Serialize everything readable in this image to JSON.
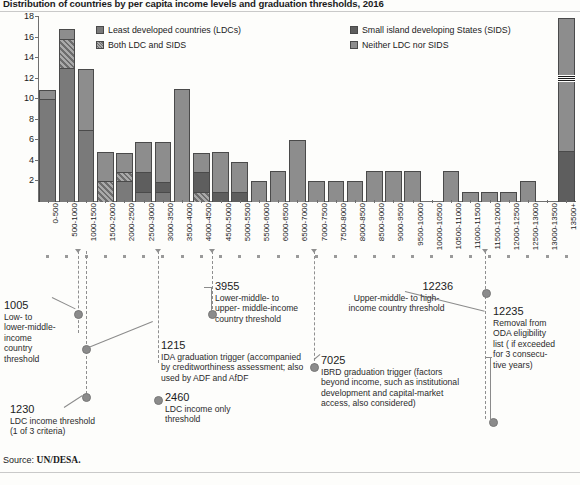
{
  "title": "Distribution of countries by per capita income levels and graduation thresholds, 2016",
  "source_prefix": "Source: ",
  "source_value": "UN/DESA.",
  "legend": {
    "items": [
      {
        "key": "ldc",
        "label": "Least developed countries (LDCs)"
      },
      {
        "key": "sids",
        "label": "Small island developing States (SIDS)"
      },
      {
        "key": "both",
        "label": "Both LDC and SIDS"
      },
      {
        "key": "neither",
        "label": "Neither LDC nor SIDS"
      }
    ]
  },
  "chart_data": {
    "type": "bar",
    "title": "Distribution of countries by per capita income levels and graduation thresholds, 2016",
    "xlabel": "",
    "ylabel": "Number of countries",
    "ylim": [
      0,
      18
    ],
    "ytick_step": 2,
    "yticks": [
      0,
      2,
      4,
      6,
      8,
      10,
      12,
      14,
      16,
      18
    ],
    "grid": false,
    "legend_position": "top-inside",
    "stacked": true,
    "axis_break_last_bar": true,
    "series_keys": [
      "ldc",
      "both",
      "sids",
      "neither"
    ],
    "categories": [
      "0-500",
      "500-1000",
      "1000-1500",
      "1500-2000",
      "2000-2500",
      "2500-3000",
      "3000-3500",
      "3500-4000",
      "4000-4500",
      "4500-5000",
      "5000-5500",
      "5500-6000",
      "6000-6500",
      "6500-7000",
      "7000-7500",
      "7500-8000",
      "8000-8500",
      "8500-9000",
      "9000-9500",
      "9500-10000",
      "10000-10500",
      "10500-11000",
      "11000-11500",
      "11500-12000",
      "12000-12500",
      "12500-13000",
      "13000-13500",
      "13500+"
    ],
    "series": [
      {
        "name": "Least developed countries (LDCs)",
        "values": [
          10,
          13,
          7,
          0,
          2,
          1,
          1,
          0,
          0,
          0,
          0,
          0,
          0,
          0,
          0,
          0,
          0,
          0,
          0,
          0,
          0,
          0,
          0,
          0,
          0,
          0,
          0,
          0
        ]
      },
      {
        "name": "Both LDC and SIDS",
        "values": [
          0,
          3,
          0,
          2,
          1,
          0,
          0,
          0,
          1,
          0,
          0,
          0,
          0,
          0,
          0,
          0,
          0,
          0,
          0,
          0,
          0,
          0,
          0,
          0,
          0,
          0,
          0,
          0
        ]
      },
      {
        "name": "Small island developing States (SIDS)",
        "values": [
          0,
          0,
          0,
          0,
          0,
          2,
          1,
          0,
          2,
          1,
          1,
          0,
          0,
          0,
          0,
          0,
          0,
          0,
          0,
          0,
          0,
          0,
          0,
          0,
          0,
          0,
          0,
          5
        ]
      },
      {
        "name": "Neither LDC nor SIDS",
        "values": [
          1,
          1,
          6,
          3,
          2,
          3,
          4,
          11,
          2,
          4,
          3,
          2,
          3,
          6,
          2,
          2,
          2,
          3,
          3,
          3,
          0,
          3,
          1,
          1,
          1,
          2,
          0,
          13
        ]
      }
    ],
    "totals": [
      11,
      17,
      13,
      5,
      5,
      6,
      6,
      11,
      5,
      5,
      4,
      2,
      3,
      6,
      2,
      2,
      2,
      3,
      3,
      3,
      0,
      3,
      1,
      1,
      1,
      2,
      0,
      18
    ],
    "annotations": [
      {
        "value": 1005,
        "label": "Low- to lower-middle-income country threshold"
      },
      {
        "value": 1215,
        "label": "IDA graduation trigger (accompanied by creditworthiness assessment; also used by ADF and AfDF)"
      },
      {
        "value": 1230,
        "label": "LDC income threshold (1 of 3 criteria)"
      },
      {
        "value": 2460,
        "label": "LDC income only threshold"
      },
      {
        "value": 3955,
        "label": "Lower-middle- to upper- middle-income country threshold"
      },
      {
        "value": 7025,
        "label": "IBRD graduation trigger (factors beyond income, such as institutional development and capital-market access, also considered)"
      },
      {
        "value": 12236,
        "label": "Upper-middle- to high-income country threshold"
      },
      {
        "value": 12235,
        "label": "Removal from ODA eligibility list ( if exceeded for 3 consecu-tive years)"
      }
    ]
  },
  "annotations_text": {
    "a1005_num": "1005",
    "a1005_l1": "Low- to",
    "a1005_l2": "lower-middle-",
    "a1005_l3": "income",
    "a1005_l4": "country",
    "a1005_l5": "threshold",
    "a1215_num": "1215",
    "a1215_l1": "IDA graduation trigger (accompanied",
    "a1215_l2": "by creditworthiness assessment; also",
    "a1215_l3": "used by ADF and AfDF",
    "a1230_num": "1230",
    "a1230_l1": "LDC income threshold",
    "a1230_l2": "(1 of 3 criteria)",
    "a2460_num": "2460",
    "a2460_l1": "LDC income only",
    "a2460_l2": "threshold",
    "a3955_num": "3955",
    "a3955_l1": "Lower-middle- to",
    "a3955_l2": "upper- middle-income",
    "a3955_l3": "country threshold",
    "a7025_num": "7025",
    "a7025_l1": "IBRD graduation trigger (factors",
    "a7025_l2": "beyond income, such as institutional",
    "a7025_l3": "development and capital-market",
    "a7025_l4": "access, also considered)",
    "a12236_num": "12236",
    "a12236_l1": "Upper-middle- to high-",
    "a12236_l2": "income country threshold",
    "a12235_num": "12235",
    "a12235_l1": "Removal from",
    "a12235_l2": "ODA eligibility",
    "a12235_l3": "list ( if exceeded",
    "a12235_l4": "for 3 consecu-",
    "a12235_l5": "tive years)"
  }
}
